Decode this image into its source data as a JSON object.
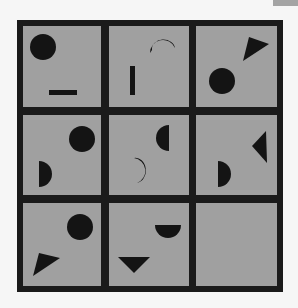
{
  "puzzle": {
    "rows": 3,
    "cols": 3,
    "colors": {
      "background": "#f6f6f6",
      "cell": "#a0a0a0",
      "border": "#1a1a1a",
      "shape": "#141414",
      "corner_tab": "#a4a4a4"
    },
    "cells": [
      {
        "row": 0,
        "col": 0,
        "shapes": [
          "circle",
          "horizontal-bar"
        ]
      },
      {
        "row": 0,
        "col": 1,
        "shapes": [
          "crescent-down",
          "vertical-bar"
        ]
      },
      {
        "row": 0,
        "col": 2,
        "shapes": [
          "triangle",
          "circle"
        ]
      },
      {
        "row": 1,
        "col": 0,
        "shapes": [
          "circle",
          "half-circle-right"
        ]
      },
      {
        "row": 1,
        "col": 1,
        "shapes": [
          "half-circle-left",
          "crescent-left"
        ]
      },
      {
        "row": 1,
        "col": 2,
        "shapes": [
          "triangle-left",
          "half-circle-right"
        ]
      },
      {
        "row": 2,
        "col": 0,
        "shapes": [
          "circle",
          "triangle"
        ]
      },
      {
        "row": 2,
        "col": 1,
        "shapes": [
          "half-circle-down",
          "triangle-down"
        ]
      },
      {
        "row": 2,
        "col": 2,
        "shapes": [],
        "missing": true
      }
    ]
  }
}
